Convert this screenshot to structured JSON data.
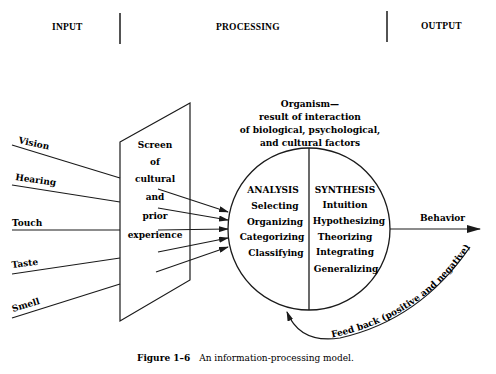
{
  "header": {
    "input_label": "INPUT",
    "processing_label": "PROCESSING",
    "output_label": "OUTPUT"
  },
  "senses": [
    {
      "label": "Vision"
    },
    {
      "label": "Hearing"
    },
    {
      "label": "Touch"
    },
    {
      "label": "Taste"
    },
    {
      "label": "Smell"
    }
  ],
  "screen": {
    "lines": [
      "Screen",
      "of",
      "cultural",
      "and",
      "prior",
      "experience"
    ]
  },
  "organism": {
    "title_lines": [
      "Organism—",
      "result of interaction",
      "of biological, psychological,",
      "and cultural factors"
    ]
  },
  "analysis": {
    "heading": "ANALYSIS",
    "items": [
      "Selecting",
      "Organizing",
      "Categorizing",
      "Classifying"
    ]
  },
  "synthesis": {
    "heading": "SYNTHESIS",
    "items": [
      "Intuition",
      "Hypothesizing",
      "Theorizing",
      "Integrating",
      "Generalizing"
    ]
  },
  "output": {
    "behavior_label": "Behavior"
  },
  "feedback": {
    "label": "Feed back (positive and negative)"
  },
  "caption": {
    "figure_number": "Figure 1–6",
    "text": "An information-processing model."
  },
  "colors": {
    "ink": "#1a1a1a",
    "background": "#ffffff"
  }
}
